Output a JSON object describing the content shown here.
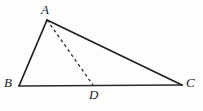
{
  "figure": {
    "name": "triangle-with-cevian",
    "background_color": "#fdfdfd",
    "stroke_color": "#1f1f1f",
    "width": 203,
    "height": 111
  },
  "labels": {
    "a": "A",
    "b": "B",
    "c": "C",
    "d": "D"
  },
  "points": {
    "A": {
      "x": 47,
      "y": 20
    },
    "B": {
      "x": 19,
      "y": 86
    },
    "C": {
      "x": 182,
      "y": 85
    },
    "D": {
      "x": 93,
      "y": 85
    }
  },
  "segments": [
    {
      "name": "side-AB",
      "from": "A",
      "to": "B",
      "style": "solid",
      "width": 1.7
    },
    {
      "name": "side-AC",
      "from": "A",
      "to": "C",
      "style": "solid",
      "width": 1.7
    },
    {
      "name": "side-BC",
      "from": "B",
      "to": "C",
      "style": "solid",
      "width": 1.7
    },
    {
      "name": "cevian-AD",
      "from": "A",
      "to": "D",
      "style": "dashed",
      "width": 1.3,
      "dash": "3,3"
    }
  ]
}
